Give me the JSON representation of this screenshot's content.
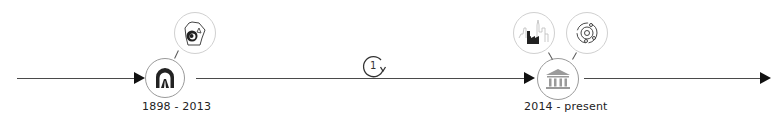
{
  "timeline": {
    "periods": [
      {
        "label": "1898 - 2013",
        "node_icon": "tunnel-icon",
        "satellites": [
          "map-location-icon"
        ]
      },
      {
        "label": "2014 - present",
        "node_icon": "museum-icon",
        "satellites": [
          "city-factory-icon",
          "network-orbit-icon"
        ]
      }
    ],
    "step": {
      "number": "1",
      "icon": "cycle-arrow-icon"
    }
  },
  "colors": {
    "line": "#4a4a4a",
    "arrow": "#111111",
    "node_border": "#9a9a9a",
    "satellite_border": "#d0d0d0",
    "icon_dark": "#222222",
    "icon_light": "#9a9a9a"
  }
}
